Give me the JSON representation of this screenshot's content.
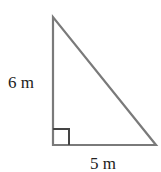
{
  "diagram": {
    "type": "right-triangle",
    "labels": {
      "vertical_side": "6 m",
      "horizontal_side": "5 m"
    },
    "right_angle_marker": true,
    "colors": {
      "stroke": "#7a7a7a",
      "marker": "#444444",
      "text": "#222222"
    }
  }
}
